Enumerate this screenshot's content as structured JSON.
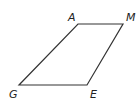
{
  "figure": {
    "type": "parallelogram",
    "stroke_color": "#333333",
    "vertices": [
      {
        "label": "A",
        "x": 78,
        "y": 24,
        "label_x": 68,
        "label_y": 21
      },
      {
        "label": "M",
        "x": 123,
        "y": 24,
        "label_x": 126,
        "label_y": 21
      },
      {
        "label": "E",
        "x": 87,
        "y": 85,
        "label_x": 90,
        "label_y": 98
      },
      {
        "label": "G",
        "x": 19,
        "y": 85,
        "label_x": 9,
        "label_y": 98
      }
    ],
    "name": "AMEG"
  }
}
